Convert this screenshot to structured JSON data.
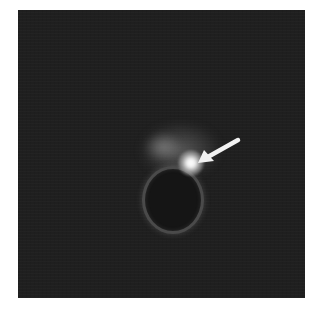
{
  "figure": {
    "type": "fluorescence-micrograph",
    "background_color": "#1f1f1f",
    "annotation": {
      "icon": "arrow-icon",
      "color": "#f2f2f2",
      "points_to": "bright focal spot"
    }
  },
  "caption": {
    "text": ""
  }
}
